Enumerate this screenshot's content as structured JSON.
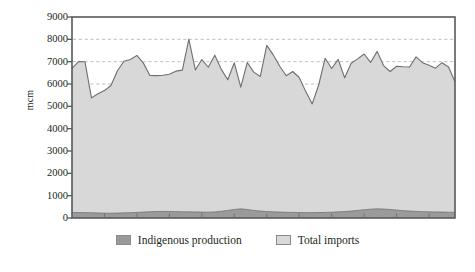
{
  "chart_data": {
    "type": "area",
    "stacked": true,
    "title": "",
    "xlabel": "",
    "ylabel": "mcm",
    "ylim": [
      0,
      9000
    ],
    "ytick_labels": [
      "9000",
      "8000",
      "7000",
      "6000",
      "5000",
      "4000",
      "3000",
      "2000",
      "1000",
      "0"
    ],
    "ytick_values": [
      9000,
      8000,
      7000,
      6000,
      5000,
      4000,
      3000,
      2000,
      1000,
      0
    ],
    "gridlines": [
      8000,
      7000,
      6000
    ],
    "grid": true,
    "legend_position": "bottom",
    "x": [
      1,
      2,
      3,
      4,
      5,
      6,
      7,
      8,
      9,
      10,
      11,
      12,
      13,
      14,
      15,
      16,
      17,
      18,
      19,
      20,
      21,
      22,
      23,
      24,
      25,
      26,
      27,
      28,
      29,
      30,
      31,
      32,
      33,
      34,
      35,
      36,
      37,
      38,
      39,
      40,
      41,
      42,
      43,
      44,
      45,
      46,
      47,
      48,
      49,
      50,
      51,
      52,
      53,
      54,
      55,
      56,
      57,
      58,
      59,
      60
    ],
    "series": [
      {
        "name": "Indigenous production",
        "color": "#9a9a9a",
        "values": [
          250,
          245,
          240,
          235,
          225,
          215,
          215,
          220,
          230,
          235,
          250,
          265,
          280,
          290,
          295,
          290,
          285,
          280,
          275,
          270,
          265,
          260,
          270,
          300,
          340,
          380,
          410,
          380,
          340,
          310,
          290,
          275,
          265,
          255,
          250,
          245,
          240,
          240,
          245,
          250,
          260,
          275,
          290,
          310,
          340,
          370,
          395,
          410,
          400,
          380,
          355,
          330,
          310,
          295,
          285,
          275,
          270,
          265,
          260,
          255
        ]
      },
      {
        "name": "Total imports",
        "color": "#d8d8d8",
        "values": [
          6450,
          6760,
          6755,
          5145,
          5335,
          5490,
          5720,
          6375,
          6790,
          6860,
          7030,
          6670,
          6100,
          6085,
          6095,
          6150,
          6290,
          6340,
          7735,
          6360,
          6830,
          6490,
          7020,
          6355,
          5850,
          6570,
          5450,
          6585,
          6190,
          6025,
          7440,
          7030,
          6530,
          6115,
          6310,
          6045,
          5430,
          4870,
          5710,
          6905,
          6435,
          6830,
          5990,
          6620,
          6785,
          6975,
          6570,
          7050,
          6425,
          6180,
          6440,
          6440,
          6450,
          6920,
          6670,
          6560,
          6440,
          6690,
          6500,
          5850
        ]
      }
    ],
    "totals": [
      6700,
      7005,
      6995,
      5380,
      5560,
      5705,
      5935,
      6595,
      7020,
      7095,
      7280,
      6935,
      6380,
      6375,
      6390,
      6440,
      6575,
      6620,
      8010,
      6630,
      7095,
      6750,
      7290,
      6655,
      6190,
      6950,
      5860,
      6965,
      6530,
      6335,
      7730,
      7305,
      6795,
      6370,
      6560,
      6290,
      5670,
      5110,
      5955,
      7155,
      6695,
      7105,
      6280,
      6930,
      7125,
      7345,
      6965,
      7460,
      6825,
      6560,
      6795,
      6770,
      6760,
      7215,
      6955,
      6835,
      6710,
      6955,
      6760,
      6105
    ]
  },
  "legend": {
    "items": [
      {
        "label": "Indigenous production",
        "color": "#9a9a9a"
      },
      {
        "label": "Total imports",
        "color": "#d8d8d8"
      }
    ]
  },
  "axis": {
    "y_title": "mcm"
  },
  "colors": {
    "indigenous": "#9a9a9a",
    "imports": "#d8d8d8",
    "axis": "#58595b",
    "grid": "#b9b9b9",
    "line": "#6d6e70"
  }
}
